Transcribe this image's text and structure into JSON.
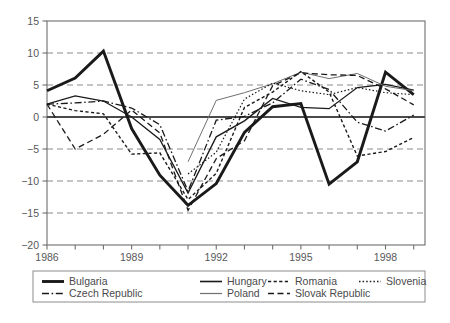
{
  "chart_data": {
    "type": "line",
    "title": "",
    "xlabel": "",
    "ylabel": "",
    "xlim": [
      1986,
      1999.4
    ],
    "ylim": [
      -20,
      15
    ],
    "ytick_values": [
      15,
      10,
      5,
      0,
      -5,
      -10,
      -15,
      -20
    ],
    "ytick_labels": [
      "15",
      "10",
      "5",
      "0",
      "−5",
      "−10",
      "−15",
      "−20"
    ],
    "xtick_values": [
      1986,
      1987,
      1988,
      1989,
      1990,
      1991,
      1992,
      1993,
      1994,
      1995,
      1996,
      1997,
      1998,
      1999
    ],
    "xtick_labels_shown": [
      "1986",
      "1989",
      "1992",
      "1995",
      "1998"
    ],
    "xtick_labeled_values": [
      1986,
      1989,
      1992,
      1995,
      1998
    ],
    "grid": "horizontal-dashed",
    "zero_line": true,
    "legend_position": "below-plot",
    "series": [
      {
        "name": "Bulgaria",
        "style": "solid-thick",
        "color": "#1a1a1a",
        "width": 2.9,
        "x": [
          1986,
          1987,
          1988,
          1989,
          1990,
          1991,
          1992,
          1993,
          1994,
          1995,
          1996,
          1997,
          1998,
          1999
        ],
        "values": [
          4.1,
          6.1,
          10.3,
          -1.8,
          -9.1,
          -13.8,
          -10.4,
          -2.4,
          1.6,
          2.1,
          -10.5,
          -7.0,
          7.0,
          3.5
        ]
      },
      {
        "name": "Hungary",
        "style": "solid",
        "color": "#1a1a1a",
        "width": 1.3,
        "x": [
          1986,
          1987,
          1988,
          1989,
          1990,
          1991,
          1992,
          1993,
          1994,
          1995,
          1996,
          1997,
          1998,
          1999
        ],
        "values": [
          2.0,
          3.3,
          2.5,
          0.0,
          -3.5,
          -11.9,
          -3.1,
          -0.6,
          2.9,
          1.5,
          1.3,
          4.6,
          5.1,
          4.2
        ]
      },
      {
        "name": "Czech Republic",
        "style": "dash-dot",
        "color": "#1a1a1a",
        "width": 1.3,
        "x": [
          1986,
          1987,
          1988,
          1989,
          1990,
          1991,
          1992,
          1993,
          1994,
          1995,
          1996,
          1997,
          1998,
          1999
        ],
        "values": [
          2.0,
          2.2,
          2.5,
          1.4,
          -1.2,
          -11.6,
          -0.5,
          0.1,
          2.2,
          5.9,
          4.3,
          -0.8,
          -2.2,
          0.3
        ]
      },
      {
        "name": "Poland",
        "style": "solid-thin-gray",
        "color": "#6f7072",
        "width": 1.0,
        "x": [
          1991,
          1992,
          1993,
          1994,
          1995,
          1996,
          1997,
          1998,
          1999
        ],
        "values": [
          -7.0,
          2.6,
          3.8,
          5.2,
          7.0,
          6.0,
          6.8,
          4.8,
          4.1
        ]
      },
      {
        "name": "Romania",
        "style": "dotted",
        "color": "#1a1a1a",
        "width": 1.4,
        "x": [
          1986,
          1987,
          1988,
          1989,
          1990,
          1991,
          1992,
          1993,
          1994,
          1995,
          1996,
          1997,
          1998,
          1999
        ],
        "values": [
          2.0,
          1.0,
          0.5,
          -5.8,
          -5.6,
          -12.9,
          -8.8,
          1.5,
          3.9,
          7.1,
          3.9,
          -6.1,
          -5.4,
          -3.2
        ]
      },
      {
        "name": "Slovak Republic",
        "style": "dashed",
        "color": "#1a1a1a",
        "width": 1.3,
        "x": [
          1986,
          1987,
          1988,
          1989,
          1990,
          1991,
          1992,
          1993,
          1994,
          1995,
          1996,
          1997,
          1998,
          1999
        ],
        "values": [
          2.0,
          -5.0,
          -2.7,
          1.1,
          -2.5,
          -14.6,
          -6.5,
          -3.7,
          4.9,
          6.9,
          6.6,
          6.5,
          4.4,
          1.9
        ]
      },
      {
        "name": "Slovenia",
        "style": "fine-dotted",
        "color": "#1a1a1a",
        "width": 1.2,
        "x": [
          1991,
          1992,
          1993,
          1994,
          1995,
          1996,
          1997,
          1998,
          1999
        ],
        "values": [
          -8.9,
          -5.5,
          2.8,
          5.3,
          4.1,
          3.5,
          4.6,
          3.8,
          3.5
        ]
      }
    ]
  },
  "legend": {
    "entries": [
      {
        "label": "Bulgaria",
        "style": "solid-thick"
      },
      {
        "label": "Hungary",
        "style": "solid"
      },
      {
        "label": "Romania",
        "style": "dotted"
      },
      {
        "label": "Slovenia",
        "style": "fine-dotted"
      },
      {
        "label": "Czech Republic",
        "style": "dash-dot"
      },
      {
        "label": "Poland",
        "style": "solid-thin-gray"
      },
      {
        "label": "Slovak Republic",
        "style": "dashed"
      }
    ]
  },
  "caption": {
    "text": ""
  },
  "colors": {
    "line": "#1a1a1a",
    "gray_line": "#6f7072",
    "grid": "#8c8c8e",
    "axis": "#6e6e70",
    "text": "#58585a",
    "background": "#ffffff"
  }
}
